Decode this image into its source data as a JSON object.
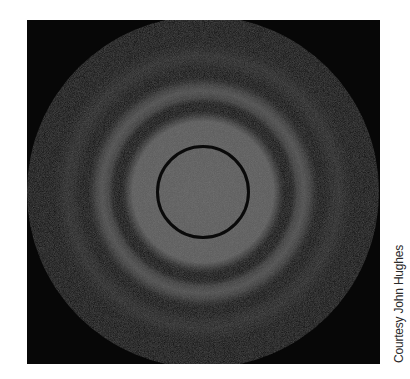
{
  "figure": {
    "colors": {
      "background": "#070707",
      "central_disk": "#5e5e5e",
      "first_bright_ring": "#4c4c4c",
      "second_bright_ring": "#252525",
      "dark_ring": "#0a0a0a"
    }
  },
  "credit": {
    "text": "Courtesy John Hughes"
  }
}
